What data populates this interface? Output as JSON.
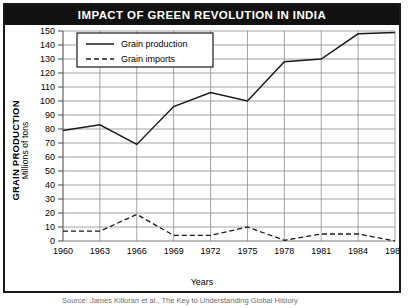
{
  "title": "IMPACT OF GREEN REVOLUTION IN INDIA",
  "caption": "Source: James Killoran et al., The Key to Understanding Global History",
  "axis": {
    "y_title_main": "GRAIN PRODUCTION",
    "y_title_sub": "Millions of tons",
    "x_title": "Years"
  },
  "chart_data": {
    "type": "line",
    "title": "IMPACT OF GREEN REVOLUTION IN INDIA",
    "xlabel": "Years",
    "ylabel": "GRAIN PRODUCTION Millions of tons",
    "x": [
      "1960",
      "1963",
      "1966",
      "1969",
      "1972",
      "1975",
      "1978",
      "1981",
      "1984",
      "1987"
    ],
    "ylim": [
      0,
      150
    ],
    "ytick_step": 10,
    "yticks": [
      "0",
      "10",
      "20",
      "30",
      "40",
      "50",
      "60",
      "70",
      "80",
      "90",
      "100",
      "110",
      "120",
      "130",
      "140",
      "150"
    ],
    "grid": true,
    "legend_position": "top-left-inside",
    "series": [
      {
        "name": "Grain production",
        "style": "solid",
        "color": "#1a1a1a",
        "values": [
          79,
          83,
          69,
          96,
          106,
          100,
          128,
          130,
          148,
          149
        ]
      },
      {
        "name": "Grain imports",
        "style": "dashed",
        "color": "#1a1a1a",
        "values": [
          7,
          7,
          19,
          4,
          4,
          10,
          0.5,
          5,
          5,
          0
        ]
      }
    ]
  }
}
